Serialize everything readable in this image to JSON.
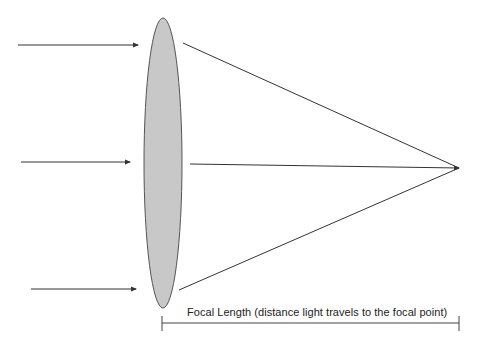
{
  "diagram": {
    "dimension_label": "Focal Length (distance light travels to the focal point)",
    "colors": {
      "lens_fill": "#c8c8c8",
      "lens_stroke": "#555555",
      "ray": "#333333",
      "background": "#ffffff"
    },
    "elements": {
      "incoming_rays": [
        {
          "name": "incoming-ray-top",
          "x1": 18,
          "y1": 45,
          "x2": 138,
          "y2": 45
        },
        {
          "name": "incoming-ray-middle",
          "x1": 21,
          "y1": 162,
          "x2": 130,
          "y2": 162
        },
        {
          "name": "incoming-ray-bottom",
          "x1": 31,
          "y1": 289,
          "x2": 136,
          "y2": 289
        }
      ],
      "lens": {
        "cx": 163,
        "cy": 163,
        "rx": 19,
        "ry": 145
      },
      "refracted_rays": [
        {
          "name": "refracted-ray-top",
          "x1": 183,
          "y1": 43,
          "x2": 459,
          "y2": 168
        },
        {
          "name": "refracted-ray-middle",
          "x1": 190,
          "y1": 164,
          "x2": 459,
          "y2": 168
        },
        {
          "name": "refracted-ray-bottom",
          "x1": 179,
          "y1": 290,
          "x2": 459,
          "y2": 168
        }
      ],
      "focal_point": {
        "x": 459,
        "y": 168
      },
      "focal_length_bar": {
        "x1": 162,
        "x2": 459,
        "y": 323,
        "tick_top": 316,
        "tick_bottom": 330
      }
    }
  }
}
